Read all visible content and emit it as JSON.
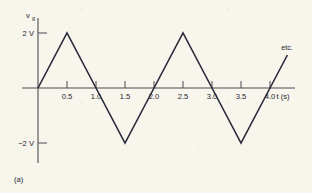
{
  "figure": {
    "caption": "(a)",
    "annotation": "etc."
  },
  "chart_data": {
    "type": "line",
    "title": "",
    "subtitle": "",
    "xlabel": "t (s)",
    "ylabel": "v",
    "ylabel_subscript": "g",
    "xlabel_full": "t (s)",
    "xticks": [
      0.5,
      1.0,
      1.5,
      2.0,
      2.5,
      3.0,
      3.5,
      4.0
    ],
    "xtick_labels": [
      "0.5",
      "1.0",
      "1.5",
      "2.0",
      "2.5",
      "3.0",
      "3.5",
      "4.0"
    ],
    "yticks": [
      2,
      -2
    ],
    "ytick_labels": [
      "2 V",
      "−2 V"
    ],
    "xlim": [
      -0.27,
      4.43
    ],
    "ylim": [
      -2.55,
      2.55
    ],
    "grid": false,
    "legend": false,
    "annotations": [
      {
        "text": "etc.",
        "x": 4.3,
        "y": 2.3
      }
    ],
    "series": [
      {
        "name": "v_g triangular wave",
        "color": "#2a2a3a",
        "x": [
          0,
          0.5,
          1.0,
          1.5,
          2.0,
          2.5,
          3.0,
          3.5,
          4.0,
          4.3
        ],
        "y": [
          0,
          2,
          0,
          -2,
          0,
          2,
          0,
          -2,
          0,
          1.2
        ]
      }
    ],
    "waveform": {
      "shape": "triangular",
      "amplitude_v": 2,
      "period_s": 2,
      "zero_crossings": [
        0,
        1,
        2,
        3,
        4
      ],
      "peaks_s": [
        0.5,
        2.5
      ],
      "troughs_s": [
        1.5,
        3.5
      ],
      "peak_value": "2 V",
      "trough_value": "−2 V"
    },
    "colors": {
      "background": "#f7f5ec",
      "axis": "#4d4d52",
      "curve": "#2a2a3a",
      "text": "#26262f"
    }
  }
}
